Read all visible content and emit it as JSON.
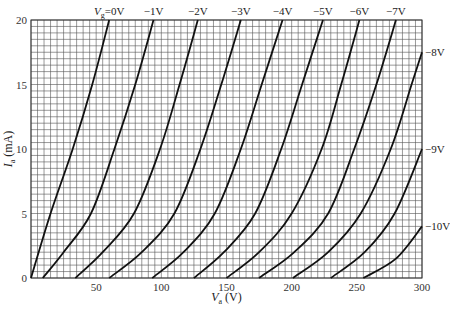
{
  "chart_data": {
    "type": "line",
    "title": "",
    "xlabel": "V_a (V)",
    "ylabel": "I_a (mA)",
    "xlim": [
      0,
      300
    ],
    "ylim": [
      0,
      20
    ],
    "grid": true,
    "grid_minor_x_step": 5,
    "grid_minor_y_step": 0.5,
    "x_ticks": [
      50,
      100,
      150,
      200,
      250,
      300
    ],
    "y_ticks": [
      0,
      5,
      10,
      15,
      20
    ],
    "legend": "curve labels at line ends",
    "series": [
      {
        "name": "Vg=0V",
        "label": "V_g=0V",
        "points": [
          [
            0,
            0
          ],
          [
            15,
            5
          ],
          [
            32,
            10
          ],
          [
            47,
            15
          ],
          [
            60,
            20
          ]
        ]
      },
      {
        "name": "-1V",
        "label": "−1V",
        "points": [
          [
            9,
            0
          ],
          [
            25,
            2
          ],
          [
            46,
            5
          ],
          [
            64,
            10
          ],
          [
            80,
            15
          ],
          [
            94,
            20
          ]
        ]
      },
      {
        "name": "-2V",
        "label": "−2V",
        "points": [
          [
            34,
            0
          ],
          [
            55,
            2
          ],
          [
            79,
            5
          ],
          [
            99,
            10
          ],
          [
            114,
            15
          ],
          [
            128,
            20
          ]
        ]
      },
      {
        "name": "-3V",
        "label": "−3V",
        "points": [
          [
            60,
            0
          ],
          [
            85,
            2
          ],
          [
            110,
            5
          ],
          [
            130,
            10
          ],
          [
            146,
            15
          ],
          [
            161,
            20
          ]
        ]
      },
      {
        "name": "-4V",
        "label": "−4V",
        "points": [
          [
            93,
            0
          ],
          [
            117,
            2
          ],
          [
            141,
            5
          ],
          [
            161,
            10
          ],
          [
            177,
            15
          ],
          [
            193,
            20
          ]
        ]
      },
      {
        "name": "-5V",
        "label": "−5V",
        "points": [
          [
            125,
            0
          ],
          [
            148,
            2
          ],
          [
            172,
            5
          ],
          [
            192,
            10
          ],
          [
            208,
            15
          ],
          [
            224,
            20
          ]
        ]
      },
      {
        "name": "-6V",
        "label": "−6V",
        "points": [
          [
            150,
            0
          ],
          [
            175,
            2
          ],
          [
            200,
            5
          ],
          [
            223,
            10
          ],
          [
            238,
            15
          ],
          [
            252,
            20
          ]
        ]
      },
      {
        "name": "-7V",
        "label": "−7V",
        "points": [
          [
            175,
            0
          ],
          [
            202,
            2
          ],
          [
            228,
            5
          ],
          [
            248,
            10
          ],
          [
            265,
            15
          ],
          [
            280,
            20
          ]
        ]
      },
      {
        "name": "-8V",
        "label": "−8V",
        "points": [
          [
            201,
            0
          ],
          [
            228,
            2
          ],
          [
            253,
            5
          ],
          [
            276,
            10
          ],
          [
            292,
            15
          ],
          [
            300,
            17.5
          ]
        ]
      },
      {
        "name": "-9V",
        "label": "−9V",
        "points": [
          [
            230,
            0
          ],
          [
            256,
            2
          ],
          [
            279,
            5
          ],
          [
            300,
            10
          ]
        ]
      },
      {
        "name": "-10V",
        "label": "−10V",
        "points": [
          [
            255,
            0
          ],
          [
            280,
            1.5
          ],
          [
            300,
            4
          ]
        ]
      }
    ]
  }
}
